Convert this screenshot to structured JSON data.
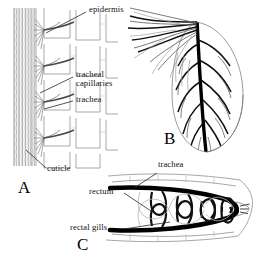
{
  "figure": {
    "background_color": "#ffffff",
    "ink_color": "#111111",
    "width": 266,
    "height": 273
  },
  "panels": [
    {
      "id": "A",
      "letter": "A",
      "name": "cuticle-epidermis-tracheal-section",
      "description": "Cross section through integument showing cuticle, epidermis cells, trachea and tracheal capillaries"
    },
    {
      "id": "B",
      "letter": "B",
      "name": "tracheal-gill-lamella",
      "description": "Leaf-shaped tracheal gill with branching tracheae"
    },
    {
      "id": "C",
      "letter": "C",
      "name": "rectal-gill-section",
      "description": "Longitudinal section of rectum bearing rectal gills supplied by trachea"
    }
  ],
  "labels": [
    {
      "id": "epidermis",
      "text": "epidermis",
      "panel": "A",
      "lines": [
        "epidermis"
      ]
    },
    {
      "id": "tracheal-capillaries",
      "text": "tracheal capillaries",
      "panel": "A",
      "lines": [
        "tracheal",
        "capillaries"
      ]
    },
    {
      "id": "trachea-a",
      "text": "trachea",
      "panel": "A",
      "lines": [
        "trachea"
      ]
    },
    {
      "id": "cuticle",
      "text": "cuticle",
      "panel": "A",
      "lines": [
        "cuticle"
      ]
    },
    {
      "id": "trachea-c",
      "text": "trachea",
      "panel": "C",
      "lines": [
        "trachea"
      ]
    },
    {
      "id": "rectum",
      "text": "rectum",
      "panel": "C",
      "lines": [
        "rectum"
      ]
    },
    {
      "id": "rectal-gills",
      "text": "rectal gills",
      "panel": "C",
      "lines": [
        "rectal gills"
      ]
    }
  ],
  "caption": {
    "text": ""
  }
}
